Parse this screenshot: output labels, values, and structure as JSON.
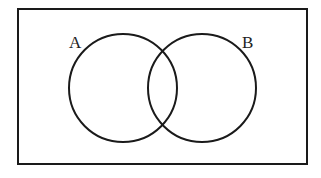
{
  "diagram": {
    "type": "venn",
    "universe": {
      "x": 18,
      "y": 9,
      "width": 289,
      "height": 155
    },
    "sets": [
      {
        "label": "A",
        "cx": 123,
        "cy": 88,
        "r": 54,
        "label_x": 69,
        "label_y": 48
      },
      {
        "label": "B",
        "cx": 202,
        "cy": 88,
        "r": 54,
        "label_x": 242,
        "label_y": 48
      }
    ],
    "stroke_color": "#1a1a1a"
  }
}
